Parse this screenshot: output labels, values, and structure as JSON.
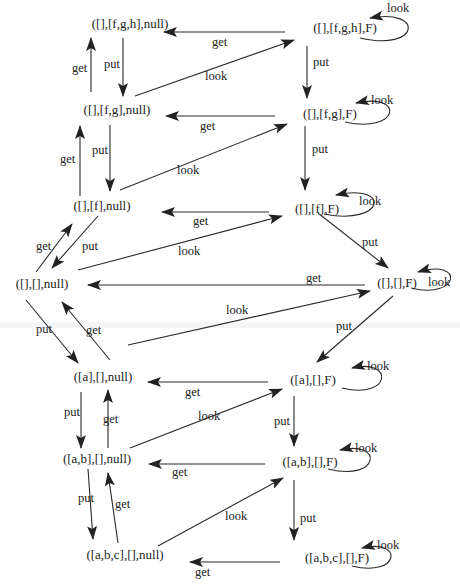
{
  "colors": {
    "ink": "#2a2a2a",
    "background": "#ffffff"
  },
  "nodes": [
    {
      "id": "n_fgh_null",
      "label": "([],[f,g,h],null)"
    },
    {
      "id": "n_fgh_F",
      "label": "([],[f,g,h],F)"
    },
    {
      "id": "n_fg_null",
      "label": "([],[f,g],null)"
    },
    {
      "id": "n_fg_F",
      "label": "([],[f,g],F)"
    },
    {
      "id": "n_f_null",
      "label": "([],[f],null)"
    },
    {
      "id": "n_f_F",
      "label": "([],[f],F)"
    },
    {
      "id": "n_e_null",
      "label": "([],[],null)"
    },
    {
      "id": "n_e_F",
      "label": "([],[],F)"
    },
    {
      "id": "n_a_null",
      "label": "([a],[],null)"
    },
    {
      "id": "n_a_F",
      "label": "([a],[],F)"
    },
    {
      "id": "n_ab_null",
      "label": "([a,b],[],null)"
    },
    {
      "id": "n_ab_F",
      "label": "([a,b],[],F)"
    },
    {
      "id": "n_abc_null",
      "label": "([a,b,c],[],null)"
    },
    {
      "id": "n_abc_F",
      "label": "([a,b,c],[],F)"
    }
  ],
  "edges": [
    {
      "from": "n_fgh_F",
      "to": "n_fgh_null",
      "label": "get"
    },
    {
      "from": "n_fg_null",
      "to": "n_fgh_F",
      "label": "look"
    },
    {
      "from": "n_fg_null",
      "to": "n_fgh_null",
      "label": "get"
    },
    {
      "from": "n_fgh_null",
      "to": "n_fg_null",
      "label": "put"
    },
    {
      "from": "n_fgh_F",
      "to": "n_fgh_F",
      "label": "look"
    },
    {
      "from": "n_fgh_F",
      "to": "n_fg_F",
      "label": "put"
    },
    {
      "from": "n_fg_F",
      "to": "n_fg_null",
      "label": "get"
    },
    {
      "from": "n_f_null",
      "to": "n_fg_F",
      "label": "look"
    },
    {
      "from": "n_fg_F",
      "to": "n_fg_F",
      "label": "look"
    },
    {
      "from": "n_f_null",
      "to": "n_fg_null",
      "label": "get"
    },
    {
      "from": "n_fg_null",
      "to": "n_f_null",
      "label": "put"
    },
    {
      "from": "n_fg_F",
      "to": "n_f_F",
      "label": "put"
    },
    {
      "from": "n_f_F",
      "to": "n_f_null",
      "label": "get"
    },
    {
      "from": "n_e_null",
      "to": "n_f_F",
      "label": "look"
    },
    {
      "from": "n_f_F",
      "to": "n_f_F",
      "label": "look"
    },
    {
      "from": "n_e_null",
      "to": "n_f_null",
      "label": "get"
    },
    {
      "from": "n_f_null",
      "to": "n_e_null",
      "label": "put"
    },
    {
      "from": "n_f_F",
      "to": "n_e_F",
      "label": "put"
    },
    {
      "from": "n_e_F",
      "to": "n_e_null",
      "label": "get"
    },
    {
      "from": "n_e_F",
      "to": "n_e_F",
      "label": "look"
    },
    {
      "from": "n_a_null",
      "to": "n_e_F",
      "label": "look"
    },
    {
      "from": "n_e_null",
      "to": "n_a_null",
      "label": "put"
    },
    {
      "from": "n_a_null",
      "to": "n_e_null",
      "label": "get"
    },
    {
      "from": "n_e_F",
      "to": "n_a_F",
      "label": "put"
    },
    {
      "from": "n_a_F",
      "to": "n_a_null",
      "label": "get"
    },
    {
      "from": "n_a_F",
      "to": "n_a_F",
      "label": "look"
    },
    {
      "from": "n_ab_null",
      "to": "n_a_F",
      "label": "look"
    },
    {
      "from": "n_a_null",
      "to": "n_ab_null",
      "label": "put"
    },
    {
      "from": "n_ab_null",
      "to": "n_a_null",
      "label": "get"
    },
    {
      "from": "n_a_F",
      "to": "n_ab_F",
      "label": "put"
    },
    {
      "from": "n_ab_F",
      "to": "n_ab_null",
      "label": "get"
    },
    {
      "from": "n_ab_F",
      "to": "n_ab_F",
      "label": "look"
    },
    {
      "from": "n_abc_null",
      "to": "n_ab_F",
      "label": "look"
    },
    {
      "from": "n_ab_null",
      "to": "n_abc_null",
      "label": "put"
    },
    {
      "from": "n_abc_null",
      "to": "n_ab_null",
      "label": "get"
    },
    {
      "from": "n_ab_F",
      "to": "n_abc_F",
      "label": "put"
    },
    {
      "from": "n_abc_F",
      "to": "n_abc_null",
      "label": "get"
    },
    {
      "from": "n_abc_F",
      "to": "n_abc_F",
      "label": "look"
    }
  ]
}
